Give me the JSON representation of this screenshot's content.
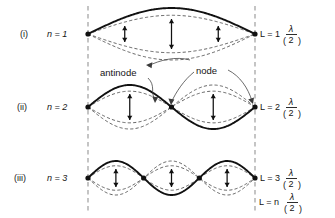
{
  "figure": {
    "background_color": "#ffffff",
    "wall_color": "#9a9a9a",
    "solid_wave_color": "#111111",
    "dashed_wave_color": "#4a4a4a",
    "left_wall_x": 88,
    "right_wall_x": 255
  },
  "annotations": {
    "antinode_label": "antinode",
    "node_label": "node"
  },
  "rows": [
    {
      "roman": "(i)",
      "mode_label": "n = 1",
      "harmonic": 1,
      "equation": "L = 1",
      "equation_paren_num": "λ",
      "equation_paren_den": "2",
      "center_y": 34,
      "amplitude": 26,
      "arrow_half_heights": [
        8,
        15,
        8
      ],
      "arrow_x_fracs": [
        0.22,
        0.5,
        0.78
      ]
    },
    {
      "roman": "(ii)",
      "mode_label": "n = 2",
      "harmonic": 2,
      "equation": "L = 2",
      "equation_paren_num": "λ",
      "equation_paren_den": "2",
      "center_y": 107,
      "amplitude": 22,
      "arrow_half_heights": [
        13,
        13
      ],
      "arrow_x_fracs": [
        0.25,
        0.75
      ]
    },
    {
      "roman": "(iii)",
      "mode_label": "n = 3",
      "harmonic": 3,
      "equation": "L = 3",
      "equation_paren_num": "λ",
      "equation_paren_den": "2",
      "center_y": 178,
      "amplitude": 17,
      "arrow_half_heights": [
        9,
        9,
        9
      ],
      "arrow_x_fracs": [
        0.167,
        0.5,
        0.833
      ]
    }
  ],
  "general_equation": {
    "lhs": "L = n",
    "paren_num": "λ",
    "paren_den": "2",
    "y": 202
  },
  "chart_data": {
    "type": "line",
    "xlabel": "",
    "ylabel": "",
    "series": [
      {
        "name": "n = 1",
        "harmonic": 1,
        "nodes": 2,
        "antinodes": 1,
        "relation": "L = 1(λ/2)"
      },
      {
        "name": "n = 2",
        "harmonic": 2,
        "nodes": 3,
        "antinodes": 2,
        "relation": "L = 2(λ/2)"
      },
      {
        "name": "n = 3",
        "harmonic": 3,
        "nodes": 4,
        "antinodes": 3,
        "relation": "L = 3(λ/2)"
      }
    ],
    "general_relation": "L = n(λ/2)"
  }
}
